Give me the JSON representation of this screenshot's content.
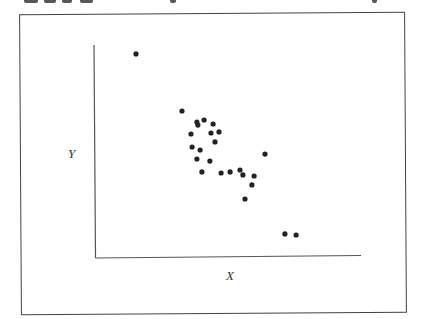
{
  "chart_data": {
    "type": "scatter",
    "title": "",
    "xlabel": "X",
    "ylabel": "Y",
    "xlim": [
      0,
      100
    ],
    "ylim": [
      0,
      100
    ],
    "grid": false,
    "ticks": "none",
    "legend": null,
    "marker_color": "#222222",
    "series": [
      {
        "name": "points",
        "x": [
          15.4,
          32.7,
          38.3,
          38.7,
          41.0,
          44.4,
          43.6,
          46.6,
          36.1,
          45.1,
          36.5,
          39.5,
          38.3,
          43.2,
          40.2,
          47.4,
          50.8,
          54.5,
          55.6,
          59.8,
          59.0,
          56.4,
          63.9,
          71.4,
          75.6
        ],
        "y": [
          95.8,
          69.0,
          63.8,
          62.4,
          64.8,
          62.9,
          58.7,
          59.2,
          58.2,
          54.5,
          52.1,
          50.7,
          46.5,
          45.5,
          40.4,
          39.9,
          40.4,
          41.3,
          39.0,
          38.5,
          34.3,
          27.7,
          48.8,
          11.3,
          10.8
        ]
      }
    ],
    "annotations": []
  },
  "labels": {
    "x_axis": "X",
    "y_axis": "Y"
  }
}
